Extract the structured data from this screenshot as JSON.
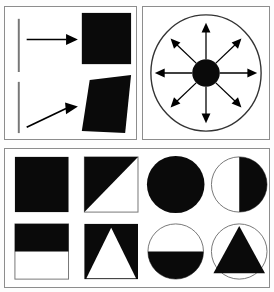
{
  "figure": {
    "background_color": "#ffffff",
    "ink_color": "#000000",
    "panel_border_color": "#8d8d8d",
    "outline_color": "#555555"
  },
  "panels": [
    {
      "id": "panel-arrows",
      "name": "arrow-transform-panel",
      "description": "Two rows: a vertical line with a horizontal arrow pointing to a black square, and a vertical line with a diagonal arrow pointing to a black parallelogram",
      "rows": [
        {
          "name": "row-square",
          "line": "vertical-line-segment",
          "arrow": "horizontal-right-arrow",
          "arrow_direction": "right",
          "result_shape": "black-square"
        },
        {
          "name": "row-parallelogram",
          "line": "vertical-line-segment",
          "arrow": "diagonal-up-right-arrow",
          "arrow_direction": "up-right",
          "result_shape": "black-parallelogram"
        }
      ]
    },
    {
      "id": "panel-radial",
      "name": "radial-arrows-panel",
      "description": "A large circle outline containing a small filled black disc at the center with eight arrows radiating outward",
      "outer_shape": "circle-outline",
      "center_shape": "filled-black-disc",
      "arrow_count": 8,
      "arrow_angles_deg": [
        0,
        45,
        90,
        135,
        180,
        225,
        270,
        315
      ]
    },
    {
      "id": "panel-shapes",
      "name": "shape-grid-panel",
      "description": "Eight shape tiles in two rows of four: squares on the left half, circles on the right half",
      "columns": 4,
      "rows": 2,
      "tiles": [
        {
          "name": "tile-square-solid",
          "base": "square",
          "fill": "solid-black",
          "label": "solid black square"
        },
        {
          "name": "tile-square-diagonal-half",
          "base": "square",
          "fill": "diagonal-half-upper-left",
          "label": "square with black upper-left triangle"
        },
        {
          "name": "tile-circle-solid",
          "base": "circle",
          "fill": "solid-black",
          "label": "solid black circle"
        },
        {
          "name": "tile-circle-right-half",
          "base": "circle",
          "fill": "right-half-black",
          "label": "circle with black right half"
        },
        {
          "name": "tile-square-top-half",
          "base": "square",
          "fill": "top-half-black",
          "label": "square with black top half"
        },
        {
          "name": "tile-square-white-triangle",
          "base": "square",
          "fill": "black-with-white-triangle",
          "label": "black square with white triangle"
        },
        {
          "name": "tile-circle-bottom-half",
          "base": "circle",
          "fill": "bottom-half-black",
          "label": "circle with black bottom half"
        },
        {
          "name": "tile-circle-black-triangle",
          "base": "circle",
          "fill": "white-with-black-triangle",
          "label": "circle outline with black triangle"
        }
      ]
    }
  ]
}
